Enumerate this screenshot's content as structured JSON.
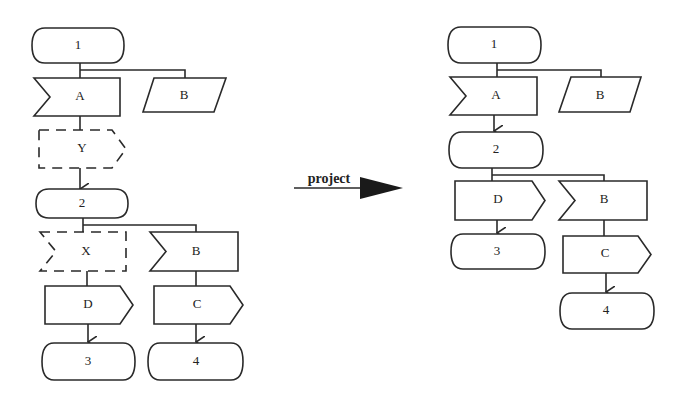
{
  "left_diagram": {
    "nodes": {
      "n1": {
        "label": "1",
        "shape": "terminator"
      },
      "A": {
        "label": "A",
        "shape": "receive"
      },
      "B_top": {
        "label": "B",
        "shape": "parallelogram"
      },
      "Y": {
        "label": "Y",
        "shape": "send",
        "style": "dashed"
      },
      "n2": {
        "label": "2",
        "shape": "terminator"
      },
      "X": {
        "label": "X",
        "shape": "receive",
        "style": "dashed"
      },
      "B_mid": {
        "label": "B",
        "shape": "receive"
      },
      "D": {
        "label": "D",
        "shape": "send"
      },
      "C": {
        "label": "C",
        "shape": "send"
      },
      "n3": {
        "label": "3",
        "shape": "terminator"
      },
      "n4": {
        "label": "4",
        "shape": "terminator"
      }
    }
  },
  "transform": {
    "label": "project"
  },
  "right_diagram": {
    "nodes": {
      "n1": {
        "label": "1",
        "shape": "terminator"
      },
      "A": {
        "label": "A",
        "shape": "receive"
      },
      "B_top": {
        "label": "B",
        "shape": "parallelogram"
      },
      "n2": {
        "label": "2",
        "shape": "terminator"
      },
      "D": {
        "label": "D",
        "shape": "send"
      },
      "B_mid": {
        "label": "B",
        "shape": "receive"
      },
      "n3": {
        "label": "3",
        "shape": "terminator"
      },
      "C": {
        "label": "C",
        "shape": "send"
      },
      "n4": {
        "label": "4",
        "shape": "terminator"
      }
    }
  }
}
